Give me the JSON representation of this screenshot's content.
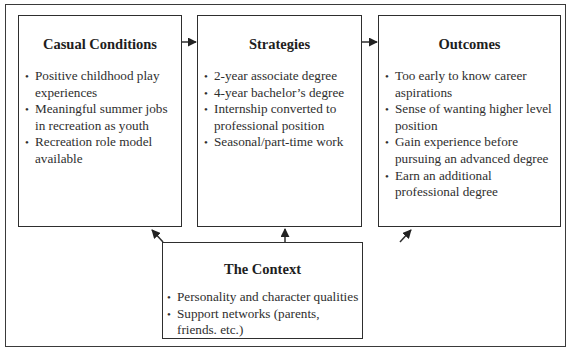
{
  "diagram": {
    "boxes": {
      "causal_conditions": {
        "title": "Casual Conditions",
        "items": [
          "Positive childhood play experiences",
          "Meaningful summer jobs in recreation as youth",
          "Recreation role model available"
        ]
      },
      "strategies": {
        "title": "Strategies",
        "items": [
          "2-year associate degree",
          "4-year bachelor’s degree",
          "Internship converted to professional position",
          "Seasonal/part-time work"
        ]
      },
      "outcomes": {
        "title": "Outcomes",
        "items": [
          "Too early to know career aspirations",
          "Sense of wanting higher level position",
          "Gain experience before pursuing an advanced degree",
          "Earn an additional professional degree"
        ]
      },
      "context": {
        "title": "The Context",
        "items": [
          "Personality and character qualities",
          "Support networks (parents, friends. etc.)"
        ]
      }
    },
    "edges": [
      {
        "from": "Casual Conditions",
        "to": "Strategies"
      },
      {
        "from": "Strategies",
        "to": "Outcomes"
      },
      {
        "from": "The Context",
        "to": "Casual Conditions"
      },
      {
        "from": "The Context",
        "to": "Strategies"
      },
      {
        "from": "The Context",
        "to": "Outcomes"
      }
    ]
  }
}
